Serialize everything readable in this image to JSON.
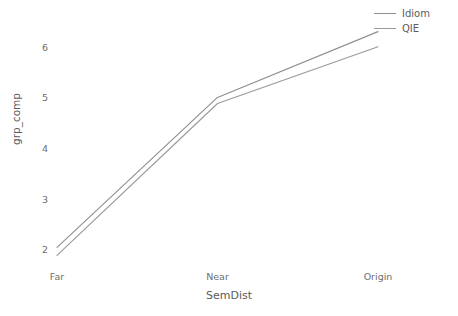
{
  "chart_data": {
    "type": "line",
    "title": "",
    "xlabel": "SemDist",
    "ylabel": "grp_comp",
    "categories": [
      "Far",
      "Near",
      "Origin"
    ],
    "series": [
      {
        "name": "Idiom",
        "values": [
          2.04,
          5.0,
          6.3
        ],
        "color": "#8f8f8f"
      },
      {
        "name": "QIE",
        "values": [
          1.88,
          4.88,
          6.0
        ],
        "color": "#9a9a9a"
      }
    ],
    "ylim": [
      1.75,
      6.45
    ],
    "yticks": [
      2,
      3,
      4,
      5,
      6
    ],
    "ytick_labels": [
      "2",
      "3",
      "4",
      "5",
      "6"
    ],
    "grid": false,
    "legend_position": "top-right",
    "background": "#ffffff"
  },
  "legend": {
    "entries": [
      {
        "label": "Idiom"
      },
      {
        "label": "QIE"
      }
    ]
  }
}
